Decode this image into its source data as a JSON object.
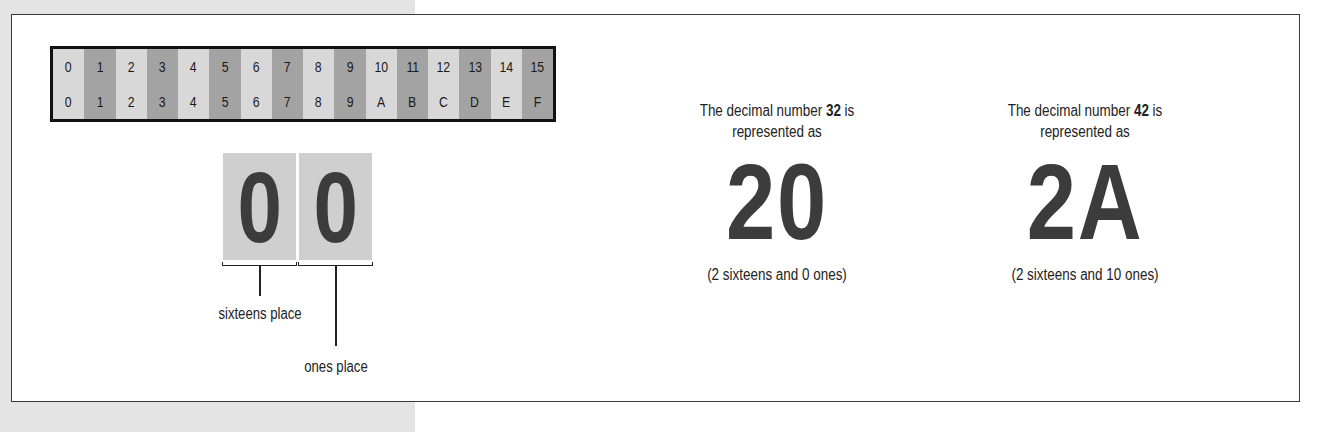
{
  "hex_table": {
    "columns": [
      {
        "decimal": "0",
        "hex": "0",
        "shade": "light"
      },
      {
        "decimal": "1",
        "hex": "1",
        "shade": "dark"
      },
      {
        "decimal": "2",
        "hex": "2",
        "shade": "light"
      },
      {
        "decimal": "3",
        "hex": "3",
        "shade": "dark"
      },
      {
        "decimal": "4",
        "hex": "4",
        "shade": "light"
      },
      {
        "decimal": "5",
        "hex": "5",
        "shade": "dark"
      },
      {
        "decimal": "6",
        "hex": "6",
        "shade": "light"
      },
      {
        "decimal": "7",
        "hex": "7",
        "shade": "dark"
      },
      {
        "decimal": "8",
        "hex": "8",
        "shade": "light"
      },
      {
        "decimal": "9",
        "hex": "9",
        "shade": "dark"
      },
      {
        "decimal": "10",
        "hex": "A",
        "shade": "light"
      },
      {
        "decimal": "11",
        "hex": "B",
        "shade": "dark"
      },
      {
        "decimal": "12",
        "hex": "C",
        "shade": "light"
      },
      {
        "decimal": "13",
        "hex": "D",
        "shade": "dark"
      },
      {
        "decimal": "14",
        "hex": "E",
        "shade": "light"
      },
      {
        "decimal": "15",
        "hex": "F",
        "shade": "dark"
      }
    ]
  },
  "place_diagram": {
    "digits": [
      "0",
      "0"
    ],
    "labels": {
      "sixteens": "sixteens place",
      "ones": "ones place"
    }
  },
  "examples": [
    {
      "caption_prefix": "The decimal number ",
      "decimal": "32",
      "caption_suffix": " is",
      "caption_line2": "represented as",
      "hex": "20",
      "note": "(2 sixteens and 0 ones)"
    },
    {
      "caption_prefix": "The decimal number ",
      "decimal": "42",
      "caption_suffix": " is",
      "caption_line2": "represented as",
      "hex": "2A",
      "note": "(2 sixteens and 10 ones)"
    }
  ],
  "colors": {
    "dark_cell": "#a3a3a3",
    "light_cell": "#d8d8d8",
    "digit_box": "#cfcfcf",
    "glyph": "#3c3c3c"
  }
}
